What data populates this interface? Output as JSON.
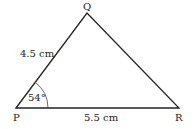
{
  "diagram": {
    "type": "triangle",
    "vertices": {
      "P": {
        "label": "P"
      },
      "Q": {
        "label": "Q"
      },
      "R": {
        "label": "R"
      }
    },
    "sides": {
      "PQ": "4.5 cm",
      "PR": "5.5 cm"
    },
    "angles": {
      "P": "54°"
    },
    "colors": {
      "stroke": "#222222",
      "background": "#ffffff"
    }
  }
}
